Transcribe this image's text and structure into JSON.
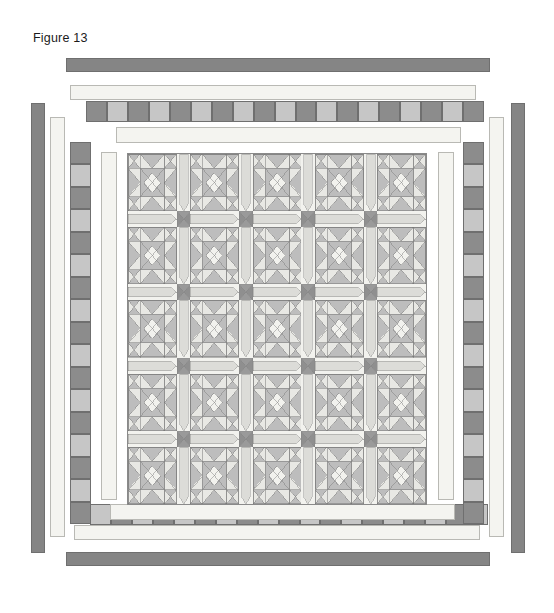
{
  "figure": {
    "label": "Figure 13",
    "type": "quilt-layout-diagram"
  },
  "colors": {
    "background": "#ffffff",
    "outer_border": "#858585",
    "outer_border_stroke": "#6f6f6f",
    "plain_border": "#f4f4f0",
    "plain_border_stroke": "#b9b9b4",
    "checker_dark": "#8c8c8c",
    "checker_light": "#c6c6c6",
    "block_background": "#f2f2ee",
    "star_dark": "#9a9a9a",
    "star_mid": "#bdbdbd",
    "star_light": "#e8e8e4",
    "sashing": "#dcdcd8",
    "cornerstone": "#8f8f8f",
    "outline": "#6f6f6f",
    "label_text": "#1b1b1b"
  },
  "center": {
    "name": "quilt-center",
    "block_rows": 5,
    "block_cols": 5,
    "block_count": 25,
    "block_name": "sawtooth-star-block",
    "sashing_rows": 4,
    "sashing_cols": 4,
    "cornerstone_count": 16,
    "bounds": {
      "x": 127,
      "y": 153,
      "width": 300,
      "height": 352
    }
  },
  "borders": [
    {
      "name": "outer-plain-border",
      "order": 1,
      "style": "plain",
      "color": "#858585",
      "sides": [
        "top",
        "bottom",
        "left",
        "right"
      ]
    },
    {
      "name": "second-plain-border",
      "order": 2,
      "style": "plain",
      "color": "#f4f4f0",
      "sides": [
        "top",
        "bottom",
        "left",
        "right"
      ]
    },
    {
      "name": "checkerboard-border",
      "order": 3,
      "style": "checkerboard",
      "squares_horizontal": 19,
      "squares_vertical": 17,
      "colors": [
        "#8c8c8c",
        "#c6c6c6"
      ],
      "sides": [
        "top",
        "bottom",
        "left",
        "right"
      ]
    },
    {
      "name": "inner-plain-border",
      "order": 4,
      "style": "plain",
      "color": "#f4f4f0",
      "sides": [
        "top",
        "bottom",
        "left",
        "right"
      ]
    }
  ],
  "bars": {
    "top_outer": {
      "x": 66,
      "y": 58,
      "w": 424,
      "h": 14
    },
    "bottom_outer": {
      "x": 66,
      "y": 552,
      "w": 424,
      "h": 14
    },
    "left_outer": {
      "x": 31,
      "y": 103,
      "w": 14,
      "h": 450
    },
    "right_outer": {
      "x": 511,
      "y": 103,
      "w": 14,
      "h": 450
    },
    "top_plain2": {
      "x": 70,
      "y": 85,
      "w": 406,
      "h": 15
    },
    "bottom_plain2": {
      "x": 74,
      "y": 525,
      "w": 406,
      "h": 15
    },
    "left_plain2": {
      "x": 50,
      "y": 117,
      "w": 15,
      "h": 420
    },
    "right_plain2": {
      "x": 489,
      "y": 117,
      "w": 15,
      "h": 420
    },
    "top_checker": {
      "x": 86,
      "y": 101,
      "w": 398,
      "h": 21
    },
    "bottom_checker": {
      "x": 90,
      "y": 504,
      "w": 398,
      "h": 21
    },
    "left_checker": {
      "x": 70,
      "y": 142,
      "w": 21,
      "h": 382
    },
    "right_checker": {
      "x": 463,
      "y": 142,
      "w": 21,
      "h": 382
    },
    "top_plain4": {
      "x": 116,
      "y": 127,
      "w": 345,
      "h": 16
    },
    "bottom_plain4": {
      "x": 110,
      "y": 504,
      "w": 345,
      "h": 16
    },
    "left_plain4": {
      "x": 101,
      "y": 152,
      "w": 16,
      "h": 348
    },
    "right_plain4": {
      "x": 438,
      "y": 152,
      "w": 16,
      "h": 348
    }
  }
}
